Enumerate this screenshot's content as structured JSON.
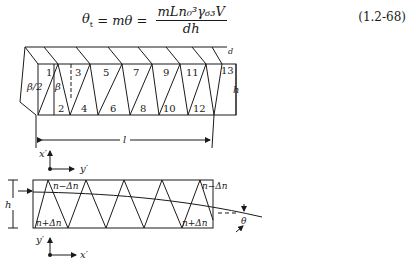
{
  "equation": {
    "lhs": "θ",
    "lhs_sub": "t",
    "middle": " = mθ = ",
    "numerator": "mLn₀³γ₆₃V",
    "denominator": "dh",
    "number": "(1.2-68)"
  },
  "prism_view": {
    "segment_labels": [
      "1",
      "2",
      "3",
      "4",
      "5",
      "6",
      "7",
      "8",
      "9",
      "10",
      "11",
      "12",
      "13"
    ],
    "beta_half": "β/2",
    "beta": "β",
    "length_label": "l",
    "height_label": "h",
    "depth_label": "d"
  },
  "top_view": {
    "axes_top": {
      "vertical": "x′",
      "horizontal": "y′"
    },
    "axes_bottom": {
      "vertical": "y′",
      "horizontal": "x′"
    },
    "height_label": "h",
    "index_low": "n−Δn",
    "index_high": "n+Δn",
    "deflection_label": "θ"
  }
}
